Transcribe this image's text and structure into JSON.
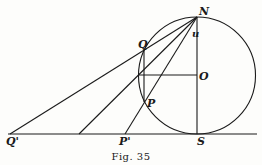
{
  "figure": {
    "caption": "Fig. 35",
    "labels": {
      "N": "N",
      "Q": "Q",
      "u": "u",
      "O": "O",
      "P": "P",
      "Q_prime": "Q'",
      "P_prime": "P'",
      "S": "S"
    },
    "points": {
      "N": [
        197,
        17
      ],
      "S": [
        197,
        134
      ],
      "O": [
        197,
        75
      ],
      "Q": [
        144,
        50
      ],
      "P": [
        144,
        102
      ],
      "Q_prime": [
        10,
        134
      ],
      "M_prime": [
        79,
        134
      ],
      "P_prime": [
        125,
        134
      ]
    },
    "circle": {
      "center": [
        197,
        75
      ],
      "radius": 59
    },
    "colors": {
      "ink": "#1a1a1a",
      "paper": "#fdfdfb"
    }
  }
}
